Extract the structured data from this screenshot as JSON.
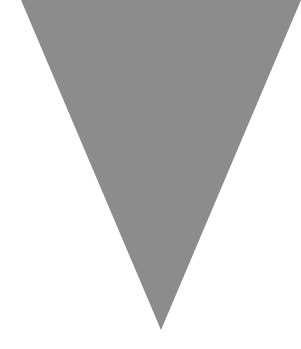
{
  "canvas": {
    "width": 301,
    "height": 349,
    "background": "#ffffff"
  },
  "shape": {
    "type": "triangle-down",
    "fill": "#8c8c8c",
    "points": [
      [
        21,
        0
      ],
      [
        301,
        0
      ],
      [
        161,
        330
      ]
    ]
  }
}
